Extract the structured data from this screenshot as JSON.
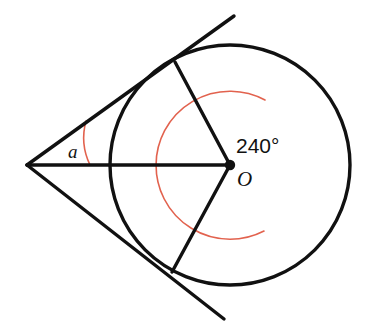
{
  "figure": {
    "type": "geometry-diagram",
    "canvas": {
      "width": 374,
      "height": 332,
      "background": "#ffffff"
    },
    "colors": {
      "ink": "#111111",
      "arc_accent": "#e2624e"
    },
    "circle": {
      "name": "main-circle",
      "center": {
        "x": 230,
        "y": 165,
        "label": "O"
      },
      "radius": 120,
      "stroke_width": 3.4
    },
    "center_dot": {
      "name": "center-point-marker",
      "radius": 5.2
    },
    "external_point": {
      "name": "external-vertex",
      "x": 27,
      "y": 165
    },
    "tangent_points": {
      "upper": {
        "x": 175,
        "y": 62
      },
      "lower": {
        "x": 172,
        "y": 272
      }
    },
    "tangent_lines": [
      {
        "name": "upper-tangent-line",
        "from": {
          "x": 27,
          "y": 165
        },
        "to": {
          "x": 234,
          "y": 16
        },
        "stroke_width": 3.4
      },
      {
        "name": "lower-tangent-line",
        "from": {
          "x": 27,
          "y": 165
        },
        "to": {
          "x": 224,
          "y": 319
        },
        "stroke_width": 3.4
      }
    ],
    "radii": [
      {
        "name": "radius-to-upper-tangent-point",
        "from": {
          "x": 230,
          "y": 165
        },
        "to": {
          "x": 175,
          "y": 62
        },
        "stroke_width": 3.4
      },
      {
        "name": "radius-to-lower-tangent-point",
        "from": {
          "x": 230,
          "y": 165
        },
        "to": {
          "x": 172,
          "y": 272
        },
        "stroke_width": 3.4
      }
    ],
    "segment_center_to_vertex": {
      "name": "segment-center-to-external-vertex",
      "from": {
        "x": 27,
        "y": 165
      },
      "to": {
        "x": 230,
        "y": 165
      },
      "stroke_width": 3.4
    },
    "reflex_arc": {
      "name": "reflex-angle-arc-240",
      "radius": 74,
      "sweep_degrees": 240,
      "start_degrees": -61.9,
      "end_degrees": 61.5,
      "path": "M 265 100 A 74 74 0 1 0 264 231",
      "stroke_width": 1.6,
      "color": "#e2624e"
    },
    "vertex_arc": {
      "name": "vertex-angle-arc",
      "radius": 63,
      "path": "M 86 121 A 63 63 0 0 0 90 165",
      "stroke_width": 1.6,
      "color": "#e2624e"
    },
    "labels": {
      "angle_measure": {
        "name": "angle-measure-label",
        "text": "240°",
        "x": 236,
        "y": 153
      },
      "center": {
        "name": "center-label-O",
        "text": "O",
        "x": 237,
        "y": 186
      },
      "vertex_angle": {
        "name": "vertex-angle-label-a",
        "text": "a",
        "x": 68,
        "y": 158
      }
    }
  }
}
